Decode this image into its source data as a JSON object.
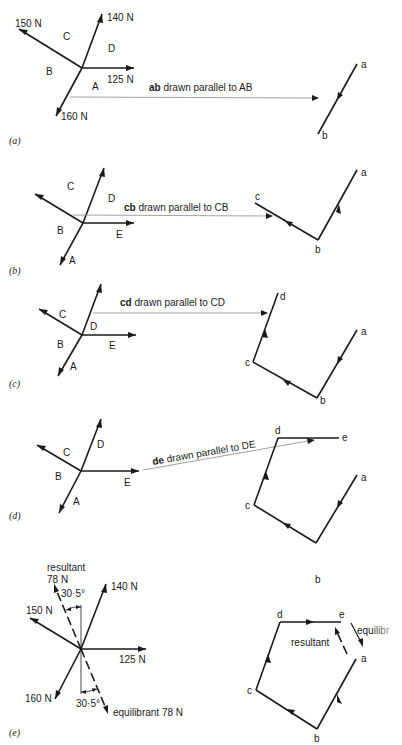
{
  "figure": {
    "panels": [
      {
        "id": "a",
        "caption": "(a)",
        "forces": [
          {
            "label": "140 N"
          },
          {
            "label": "150 N"
          },
          {
            "label": "125 N"
          },
          {
            "label": "160 N"
          }
        ],
        "spaces": [
          "A",
          "B",
          "C",
          "D"
        ],
        "note": {
          "bold": "ab",
          "text": " drawn parallel to AB"
        },
        "polygon_points": [
          "a",
          "b"
        ]
      },
      {
        "id": "b",
        "caption": "(b)",
        "spaces": [
          "A",
          "B",
          "C",
          "D",
          "E"
        ],
        "note": {
          "bold": "cb",
          "text": " drawn parallel to CB"
        },
        "polygon_points": [
          "a",
          "b",
          "c"
        ]
      },
      {
        "id": "c",
        "caption": "(c)",
        "spaces": [
          "A",
          "B",
          "C",
          "D",
          "E"
        ],
        "note": {
          "bold": "cd",
          "text": " drawn parallel to CD"
        },
        "polygon_points": [
          "a",
          "b",
          "c",
          "d"
        ]
      },
      {
        "id": "d",
        "caption": "(d)",
        "spaces": [
          "A",
          "B",
          "C",
          "D",
          "E"
        ],
        "note": {
          "bold": "de",
          "text": " drawn parallel to DE"
        },
        "polygon_points": [
          "a",
          "b",
          "c",
          "d",
          "e"
        ]
      },
      {
        "id": "e",
        "caption": "(e)",
        "forces": [
          {
            "label": "140 N"
          },
          {
            "label": "150 N"
          },
          {
            "label": "125 N"
          },
          {
            "label": "160 N"
          }
        ],
        "resultant": {
          "label": "resultant",
          "magnitude": "78 N",
          "angle": "30·5°"
        },
        "equilibrant": {
          "label": "equilibrant 78 N",
          "angle": "30·5°"
        },
        "polygon_points": [
          "a",
          "b",
          "c",
          "d",
          "e"
        ],
        "polygon_resultant_label": "resultant",
        "polygon_equilibrant_label": "equilibr",
        "orphan_label": "b"
      }
    ]
  }
}
